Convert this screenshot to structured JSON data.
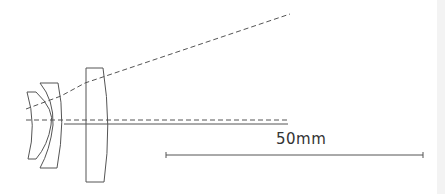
{
  "diagram": {
    "type": "optical-lens-cross-section",
    "elements": [
      {
        "id": "lens-1",
        "kind": "meniscus"
      },
      {
        "id": "lens-2",
        "kind": "meniscus"
      },
      {
        "id": "lens-3",
        "kind": "plano-convex"
      }
    ],
    "lines": {
      "optical_axis": "dashed",
      "chief_ray": "dashed",
      "marginal_ray": "solid"
    },
    "colors": {
      "stroke": "#555555",
      "background": "#ffffff"
    }
  },
  "scale_bar": {
    "label": "50mm",
    "length_px": 257
  }
}
